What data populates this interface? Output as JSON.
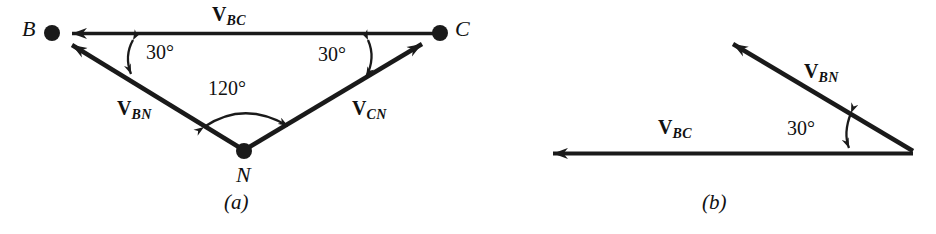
{
  "figure": {
    "background_color": "#ffffff",
    "stroke_color": "#1a1a1a",
    "panels": [
      {
        "caption": "(a)",
        "type": "vector-triangle-diagram",
        "nodes": [
          {
            "label": "B",
            "x": 52,
            "y": 33
          },
          {
            "label": "C",
            "x": 440,
            "y": 33
          },
          {
            "label": "N",
            "x": 244,
            "y": 151
          }
        ],
        "vectors": [
          {
            "label_v": "V",
            "label_sub": "BC",
            "from": "C",
            "to": "B"
          },
          {
            "label_v": "V",
            "label_sub": "BN",
            "from": "N",
            "to": "B"
          },
          {
            "label_v": "V",
            "label_sub": "CN",
            "from": "N",
            "to": "C"
          }
        ],
        "angles": [
          {
            "value": "30°",
            "at": "B"
          },
          {
            "value": "30°",
            "at": "C"
          },
          {
            "value": "120°",
            "at": "N"
          }
        ]
      },
      {
        "caption": "(b)",
        "type": "vector-triangle-diagram",
        "vectors": [
          {
            "label_v": "V",
            "label_sub": "BN",
            "direction": "up-left"
          },
          {
            "label_v": "V",
            "label_sub": "BC",
            "direction": "left"
          }
        ],
        "angles": [
          {
            "value": "30°",
            "at": "right-vertex"
          }
        ]
      }
    ]
  },
  "labels": {
    "a": {
      "node_b": "B",
      "node_c": "C",
      "node_n": "N",
      "vbc_v": "V",
      "vbc_sub": "BC",
      "vbn_v": "V",
      "vbn_sub": "BN",
      "vcn_v": "V",
      "vcn_sub": "CN",
      "angle_left": "30°",
      "angle_right": "30°",
      "angle_bottom": "120°",
      "caption": "(a)"
    },
    "b": {
      "vbn_v": "V",
      "vbn_sub": "BN",
      "vbc_v": "V",
      "vbc_sub": "BC",
      "angle": "30°",
      "caption": "(b)"
    }
  }
}
